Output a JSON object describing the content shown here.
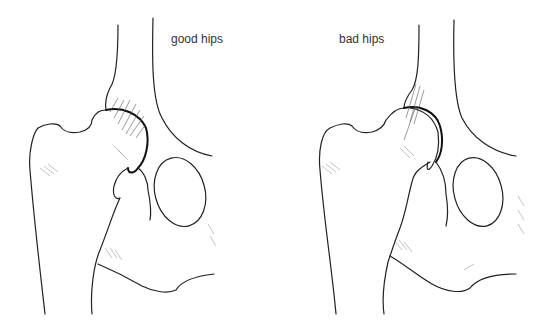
{
  "figure": {
    "panels": [
      {
        "id": "good",
        "label": "good hips"
      },
      {
        "id": "bad",
        "label": "bad hips"
      }
    ],
    "colors": {
      "line": "#222222",
      "text": "#333333",
      "background": "#ffffff"
    }
  }
}
